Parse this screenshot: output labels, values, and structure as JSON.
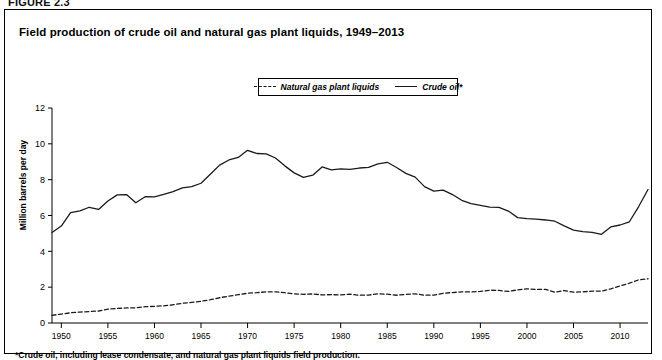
{
  "figure_label": "FIGURE 2.3",
  "title": "Field production of crude oil and natural gas plant liquids, 1949–2013",
  "footnote": "*Crude oil, including lease condensate, and natural gas plant liquids field production.",
  "legend": {
    "items": [
      {
        "label": "Natural gas plant liquids",
        "style": "dashed",
        "color": "#1a1a1a"
      },
      {
        "label": "Crude oil*",
        "style": "solid",
        "color": "#1a1a1a"
      }
    ]
  },
  "axes": {
    "ylabel": "Million barrels per day",
    "yticks": [
      "0",
      "2",
      "4",
      "6",
      "8",
      "10",
      "12"
    ],
    "xticks": [
      "1950",
      "1955",
      "1960",
      "1965",
      "1970",
      "1975",
      "1980",
      "1985",
      "1990",
      "1995",
      "2000",
      "2005",
      "2010"
    ]
  },
  "chart_data": {
    "type": "line",
    "title": "Field production of crude oil and natural gas plant liquids, 1949–2013",
    "xlabel": "",
    "ylabel": "Million barrels per day",
    "xlim": [
      1949,
      2013
    ],
    "ylim": [
      0,
      12
    ],
    "yticks": [
      0,
      2,
      4,
      6,
      8,
      10,
      12
    ],
    "xticks": [
      1950,
      1955,
      1960,
      1965,
      1970,
      1975,
      1980,
      1985,
      1990,
      1995,
      2000,
      2005,
      2010
    ],
    "grid": false,
    "legend_position": "top-center",
    "annotations": [
      "*Crude oil, including lease condensate, and natural gas plant liquids field production."
    ],
    "x": [
      1949,
      1950,
      1951,
      1952,
      1953,
      1954,
      1955,
      1956,
      1957,
      1958,
      1959,
      1960,
      1961,
      1962,
      1963,
      1964,
      1965,
      1966,
      1967,
      1968,
      1969,
      1970,
      1971,
      1972,
      1973,
      1974,
      1975,
      1976,
      1977,
      1978,
      1979,
      1980,
      1981,
      1982,
      1983,
      1984,
      1985,
      1986,
      1987,
      1988,
      1989,
      1990,
      1991,
      1992,
      1993,
      1994,
      1995,
      1996,
      1997,
      1998,
      1999,
      2000,
      2001,
      2002,
      2003,
      2004,
      2005,
      2006,
      2007,
      2008,
      2009,
      2010,
      2011,
      2012,
      2013
    ],
    "series": [
      {
        "name": "Crude oil*",
        "style": "solid",
        "color": "#1a1a1a",
        "values": [
          5.05,
          5.41,
          6.16,
          6.26,
          6.46,
          6.34,
          6.81,
          7.15,
          7.17,
          6.71,
          7.05,
          7.04,
          7.18,
          7.33,
          7.54,
          7.61,
          7.8,
          8.3,
          8.81,
          9.1,
          9.24,
          9.64,
          9.46,
          9.44,
          9.21,
          8.77,
          8.38,
          8.13,
          8.25,
          8.71,
          8.55,
          8.6,
          8.57,
          8.65,
          8.69,
          8.88,
          8.97,
          8.68,
          8.35,
          8.14,
          7.61,
          7.36,
          7.42,
          7.17,
          6.85,
          6.66,
          6.56,
          6.47,
          6.45,
          6.25,
          5.88,
          5.82,
          5.8,
          5.75,
          5.68,
          5.42,
          5.18,
          5.1,
          5.06,
          4.95,
          5.36,
          5.47,
          5.65,
          6.5,
          7.45
        ]
      },
      {
        "name": "Natural gas plant liquids",
        "style": "dashed",
        "color": "#1a1a1a",
        "values": [
          0.43,
          0.5,
          0.57,
          0.61,
          0.64,
          0.67,
          0.77,
          0.81,
          0.84,
          0.85,
          0.91,
          0.93,
          0.96,
          1.02,
          1.1,
          1.15,
          1.21,
          1.3,
          1.41,
          1.5,
          1.58,
          1.66,
          1.69,
          1.74,
          1.74,
          1.69,
          1.63,
          1.6,
          1.62,
          1.57,
          1.58,
          1.57,
          1.61,
          1.55,
          1.56,
          1.63,
          1.61,
          1.55,
          1.6,
          1.63,
          1.55,
          1.56,
          1.66,
          1.7,
          1.74,
          1.73,
          1.76,
          1.83,
          1.82,
          1.76,
          1.85,
          1.91,
          1.87,
          1.88,
          1.72,
          1.81,
          1.72,
          1.74,
          1.78,
          1.78,
          1.91,
          2.07,
          2.22,
          2.41,
          2.47
        ]
      }
    ]
  }
}
